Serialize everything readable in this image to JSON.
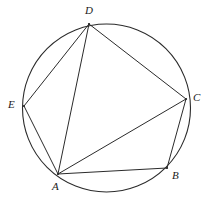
{
  "figure": {
    "kind": "cyclic-polygon-diagram",
    "canvas": {
      "width": 213,
      "height": 211
    },
    "background_color": "#ffffff",
    "stroke_color": "#2b2b2b",
    "circle": {
      "name": "circumscribed-circle",
      "cx": 106.5,
      "cy": 108,
      "r": 84,
      "stroke_width": 1.1
    },
    "points": [
      {
        "id": "A",
        "label": "A",
        "x": 58,
        "y": 174,
        "label_x": 52,
        "label_y": 181
      },
      {
        "id": "B",
        "label": "B",
        "x": 167,
        "y": 168,
        "label_x": 172,
        "label_y": 170
      },
      {
        "id": "C",
        "label": "C",
        "x": 186,
        "y": 99,
        "label_x": 193,
        "label_y": 92
      },
      {
        "id": "D",
        "label": "D",
        "x": 89,
        "y": 24,
        "label_x": 85,
        "label_y": 5
      },
      {
        "id": "E",
        "label": "E",
        "x": 24,
        "y": 106,
        "label_x": 8,
        "label_y": 99
      }
    ],
    "segments": [
      {
        "id": "DE",
        "from": "D",
        "to": "E",
        "label": "D-E"
      },
      {
        "id": "DA",
        "from": "D",
        "to": "A",
        "label": "D-A"
      },
      {
        "id": "DC",
        "from": "D",
        "to": "C",
        "label": "D-C"
      },
      {
        "id": "EA",
        "from": "E",
        "to": "A",
        "label": "E-A"
      },
      {
        "id": "AB",
        "from": "A",
        "to": "B",
        "label": "A-B"
      },
      {
        "id": "AC",
        "from": "A",
        "to": "C",
        "label": "A-C"
      },
      {
        "id": "BC",
        "from": "B",
        "to": "C",
        "label": "B-C"
      }
    ]
  }
}
